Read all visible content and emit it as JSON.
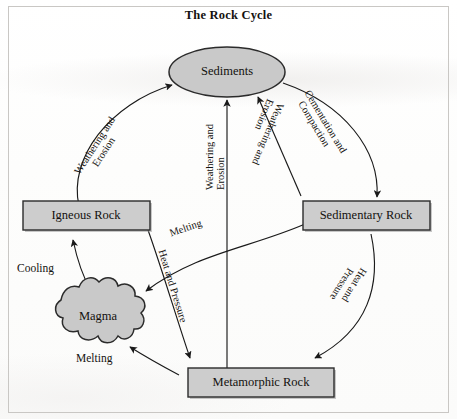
{
  "diagram": {
    "title": "The Rock Cycle",
    "type": "cycle-diagram",
    "colors": {
      "node_fill": "#c9c9c9",
      "node_stroke": "#2b2b2b",
      "arrow": "#1a1a1a",
      "text": "#14120f",
      "page": "#ffffff",
      "frame": "#c9c7c4"
    },
    "nodes": [
      {
        "id": "sediments",
        "label": "Sediments",
        "shape": "ellipse",
        "x": 227,
        "y": 72
      },
      {
        "id": "igneous",
        "label": "Igneous Rock",
        "shape": "rectangle",
        "x": 88,
        "y": 217
      },
      {
        "id": "sedimentary",
        "label": "Sedimentary Rock",
        "shape": "rectangle",
        "x": 367,
        "y": 217
      },
      {
        "id": "magma",
        "label": "Magma",
        "shape": "blob",
        "x": 90,
        "y": 315
      },
      {
        "id": "metamorphic",
        "label": "Metamorphic Rock",
        "shape": "rectangle",
        "x": 262,
        "y": 382
      }
    ],
    "edges": [
      {
        "id": "igneous-to-sediments",
        "from": "igneous",
        "to": "sediments",
        "label_lines": [
          "Weathering and",
          "Erosion"
        ]
      },
      {
        "id": "sediments-to-sedimentary",
        "from": "sediments",
        "to": "sedimentary",
        "label_lines": [
          "Cementation and",
          "Compaction"
        ]
      },
      {
        "id": "metamorphic-to-sediments",
        "from": "metamorphic",
        "to": "sediments",
        "label_lines": [
          "Weathering and",
          "Erosion"
        ]
      },
      {
        "id": "sedimentary-to-sediments",
        "from": "sedimentary",
        "to": "sediments",
        "label_lines": [
          "Weathering and",
          "Erosion"
        ]
      },
      {
        "id": "sedimentary-to-magma",
        "from": "sedimentary",
        "to": "magma",
        "label_lines": [
          "Melting"
        ]
      },
      {
        "id": "igneous-to-metamorphic",
        "from": "igneous",
        "to": "metamorphic",
        "label_lines": [
          "Heat and Pressure"
        ]
      },
      {
        "id": "sedimentary-to-metamorphic",
        "from": "sedimentary",
        "to": "metamorphic",
        "label_lines": [
          "Heat and",
          "Pressure"
        ]
      },
      {
        "id": "magma-to-igneous",
        "from": "magma",
        "to": "igneous",
        "label_lines": [
          "Cooling"
        ]
      },
      {
        "id": "metamorphic-to-magma",
        "from": "metamorphic",
        "to": "magma",
        "label_lines": [
          "Melting"
        ]
      }
    ],
    "labels": {
      "weathering_erosion_line1": "Weathering and",
      "weathering_erosion_line2": "Erosion",
      "cementation_line1": "Cementation and",
      "cementation_line2": "Compaction",
      "melting": "Melting",
      "melting_bottom": "Melting",
      "heat_pressure": "Heat and Pressure",
      "heat_line1": "Heat and",
      "heat_line2": "Pressure",
      "cooling": "Cooling"
    }
  }
}
